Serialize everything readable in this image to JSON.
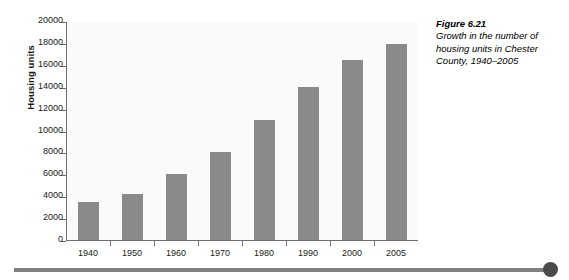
{
  "chart_data": {
    "type": "bar",
    "title": "",
    "xlabel": "",
    "ylabel": "Housing units",
    "categories": [
      "1940",
      "1950",
      "1960",
      "1970",
      "1980",
      "1990",
      "2000",
      "2005"
    ],
    "values": [
      3500,
      4200,
      6000,
      8000,
      11000,
      14000,
      16400,
      17900
    ],
    "ylim": [
      0,
      20000
    ],
    "ytick_step": 2000,
    "ytick_labels": [
      "0",
      "2000",
      "4000",
      "6000",
      "8000",
      "10000",
      "12000",
      "14000",
      "16000",
      "18000",
      "20000"
    ],
    "ytick_values": [
      0,
      2000,
      4000,
      6000,
      8000,
      10000,
      12000,
      14000,
      16000,
      18000,
      20000
    ],
    "grid": false,
    "legend": false,
    "legend_position": "none",
    "bar_color": "#8a8a8a",
    "plot_background": "#fafafa",
    "axis_color": "#6f6f6f"
  },
  "caption": {
    "figure_number": "Figure 6.21",
    "description": "Growth in the number of housing units in Chester County, 1940–2005"
  },
  "decoration": {
    "rule_color": "#808080",
    "knob_color": "#4a4a4a"
  }
}
